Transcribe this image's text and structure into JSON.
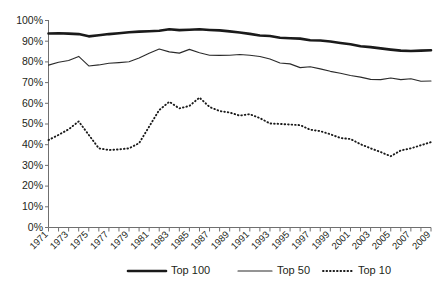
{
  "chart_data": {
    "type": "line",
    "title": "",
    "xlabel": "",
    "ylabel": "",
    "ylim": [
      0,
      100
    ],
    "ytick_labels": [
      "0%",
      "10%",
      "20%",
      "30%",
      "40%",
      "50%",
      "60%",
      "70%",
      "80%",
      "90%",
      "100%"
    ],
    "ytick_values": [
      0,
      10,
      20,
      30,
      40,
      50,
      60,
      70,
      80,
      90,
      100
    ],
    "grid": false,
    "legend_position": "bottom-center",
    "x": [
      1971,
      1972,
      1973,
      1974,
      1975,
      1976,
      1977,
      1978,
      1979,
      1980,
      1981,
      1982,
      1983,
      1984,
      1985,
      1986,
      1987,
      1988,
      1989,
      1990,
      1991,
      1992,
      1993,
      1994,
      1995,
      1996,
      1997,
      1998,
      1999,
      2000,
      2001,
      2002,
      2003,
      2004,
      2005,
      2006,
      2007,
      2008,
      2009
    ],
    "xtick_labels": [
      "1971",
      "1973",
      "1975",
      "1977",
      "1979",
      "1981",
      "1983",
      "1985",
      "1987",
      "1989",
      "1991",
      "1993",
      "1995",
      "1997",
      "1999",
      "2001",
      "2003",
      "2005",
      "2007",
      "2009"
    ],
    "xlim": [
      1971,
      2009
    ],
    "series": [
      {
        "name": "Top 100",
        "style": "thick-solid",
        "color": "#1a1a1a",
        "values": [
          93.5,
          93.6,
          93.4,
          93.2,
          92.1,
          92.6,
          93.2,
          93.6,
          94.1,
          94.4,
          94.6,
          94.8,
          95.5,
          95.1,
          95.3,
          95.5,
          95.2,
          95.0,
          94.5,
          94.0,
          93.3,
          92.5,
          92.3,
          91.4,
          91.2,
          91.0,
          90.2,
          90.1,
          89.6,
          88.9,
          88.3,
          87.3,
          86.9,
          86.3,
          85.7,
          85.2,
          85.0,
          85.2,
          85.4
        ]
      },
      {
        "name": "Top 50",
        "style": "thin-solid",
        "color": "#2b2b2b",
        "values": [
          78.2,
          79.6,
          80.4,
          82.4,
          77.8,
          78.3,
          79.1,
          79.4,
          79.8,
          81.6,
          83.9,
          86.0,
          84.6,
          84.0,
          85.8,
          84.2,
          83.0,
          82.9,
          83.0,
          83.3,
          83.0,
          82.4,
          81.2,
          79.2,
          78.8,
          77.0,
          77.4,
          76.4,
          75.2,
          74.3,
          73.2,
          72.4,
          71.3,
          71.2,
          72.0,
          71.2,
          71.6,
          70.4,
          70.5
        ]
      },
      {
        "name": "Top 10",
        "style": "dotted",
        "color": "#1a1a1a",
        "values": [
          42.0,
          44.5,
          47.2,
          51.0,
          44.5,
          38.0,
          37.2,
          37.5,
          38.0,
          40.5,
          48.5,
          56.5,
          60.5,
          57.3,
          58.5,
          62.5,
          58.0,
          56.0,
          55.3,
          53.8,
          54.5,
          52.6,
          50.0,
          49.8,
          49.5,
          49.2,
          47.0,
          46.3,
          44.8,
          43.0,
          42.5,
          40.0,
          38.0,
          36.2,
          34.2,
          37.0,
          38.0,
          39.5,
          41.0
        ]
      }
    ]
  },
  "legend": {
    "items": [
      {
        "label": "Top 100"
      },
      {
        "label": "Top 50"
      },
      {
        "label": "Top 10"
      }
    ]
  }
}
